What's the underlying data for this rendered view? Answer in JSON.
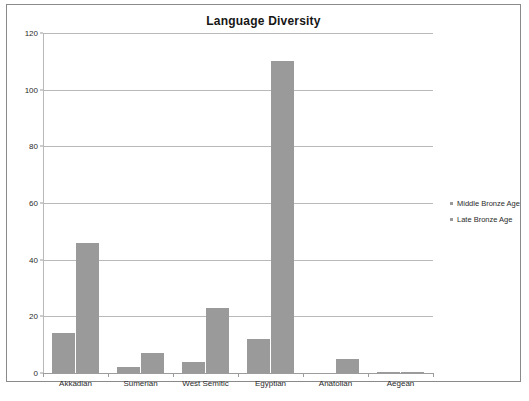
{
  "chart_data": {
    "type": "bar",
    "title": "Language Diversity",
    "xlabel": "",
    "ylabel": "",
    "ylim": [
      0,
      120
    ],
    "yticks": [
      0,
      20,
      40,
      60,
      80,
      100,
      120
    ],
    "grid": true,
    "legend_position": "right",
    "categories": [
      "Akkadian",
      "Sumerian",
      "West Semitic",
      "Egyptian",
      "Anatolian",
      "Aegean"
    ],
    "series": [
      {
        "name": "Middle Bronze Age",
        "color": "#9a9a9a",
        "values": [
          14,
          2,
          4,
          12,
          0,
          0.5
        ]
      },
      {
        "name": "Late Bronze Age",
        "color": "#9a9a9a",
        "values": [
          46,
          7,
          23,
          110,
          5,
          0.5
        ]
      }
    ]
  },
  "legend": {
    "items": [
      {
        "label": "Middle Bronze Age",
        "marker": "square-marker"
      },
      {
        "label": "Late Bronze Age",
        "marker": "square-marker"
      }
    ]
  },
  "colors": {
    "bar_fill": "#9a9a9a",
    "gridline": "#b9b9b9",
    "axis": "#9c9c9c",
    "frame_border": "#8a8a8a",
    "text": "#2b2b2b",
    "title_text": "#161616",
    "background": "#ffffff"
  }
}
